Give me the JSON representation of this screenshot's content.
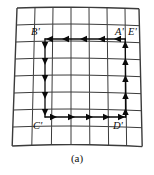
{
  "figure": {
    "caption": "(a)",
    "background_color": "#ffffff",
    "grid_line_color": "#3b3b3b",
    "path_color": "#0a0a0a",
    "grid": {
      "columns": 8,
      "rows": 8,
      "description": "slightly distorted quadrilateral mesh"
    },
    "labels": {
      "a": "A'",
      "b": "B'",
      "c": "C'",
      "d": "D'",
      "e": "E'"
    },
    "path": {
      "top_direction": "left",
      "left_direction": "down",
      "bottom_direction": "right",
      "right_direction": "up",
      "arrow_count_top": 5,
      "arrow_count_left": 5,
      "arrow_count_bottom": 5,
      "arrow_count_right": 5
    }
  }
}
